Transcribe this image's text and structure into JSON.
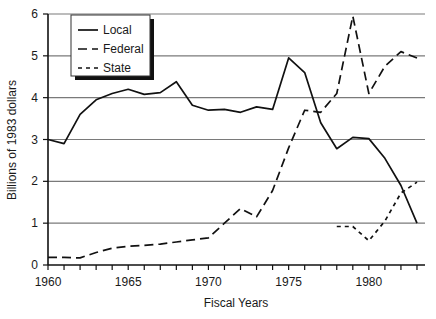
{
  "chart_data": {
    "type": "line",
    "title": "",
    "xlabel": "Fiscal Years",
    "ylabel": "Billions of 1983 dollars",
    "xlim": [
      1960,
      1983.5
    ],
    "ylim": [
      0,
      6
    ],
    "ytick_labels": [
      "0",
      "1",
      "2",
      "3",
      "4",
      "5",
      "6"
    ],
    "ytick_values": [
      0,
      1,
      2,
      3,
      4,
      5,
      6
    ],
    "xtick_labels": [
      "1960",
      "1965",
      "1970",
      "1975",
      "1980"
    ],
    "xtick_values": [
      1960,
      1965,
      1970,
      1975,
      1980
    ],
    "xminor_step": 1,
    "grid": "horizontal",
    "legend_position": "top-left",
    "series": [
      {
        "name": "Local",
        "style": "solid",
        "x": [
          1960,
          1961,
          1962,
          1963,
          1964,
          1965,
          1966,
          1967,
          1968,
          1969,
          1970,
          1971,
          1972,
          1973,
          1974,
          1975,
          1976,
          1977,
          1978,
          1979,
          1980,
          1981,
          1982,
          1983
        ],
        "values": [
          3.0,
          2.9,
          3.6,
          3.95,
          4.1,
          4.2,
          4.08,
          4.12,
          4.38,
          3.82,
          3.7,
          3.72,
          3.65,
          3.78,
          3.72,
          4.95,
          4.6,
          3.4,
          2.78,
          3.05,
          3.02,
          2.55,
          1.9,
          1.0
        ]
      },
      {
        "name": "Federal",
        "style": "dashed",
        "x": [
          1960,
          1961,
          1962,
          1963,
          1964,
          1965,
          1966,
          1967,
          1968,
          1969,
          1970,
          1971,
          1972,
          1973,
          1974,
          1975,
          1976,
          1977,
          1978,
          1979,
          1980,
          1981,
          1982,
          1983
        ],
        "values": [
          0.18,
          0.18,
          0.17,
          0.3,
          0.4,
          0.45,
          0.47,
          0.5,
          0.55,
          0.6,
          0.65,
          1.0,
          1.35,
          1.15,
          1.78,
          2.8,
          3.7,
          3.65,
          4.1,
          5.95,
          4.1,
          4.75,
          5.1,
          4.95
        ]
      },
      {
        "name": "State",
        "style": "shortdash",
        "x": [
          1978,
          1979,
          1980,
          1981,
          1982,
          1983
        ],
        "values": [
          0.92,
          0.92,
          0.58,
          1.05,
          1.72,
          1.98
        ]
      }
    ],
    "legend": [
      {
        "label": "Local",
        "style": "solid"
      },
      {
        "label": "Federal",
        "style": "dashed"
      },
      {
        "label": "State",
        "style": "shortdash"
      }
    ]
  },
  "colors": {
    "line": "#111111",
    "grid": "#7a7a7a",
    "axis": "#111111",
    "background": "#ffffff",
    "legend_shadow": "#111111"
  }
}
